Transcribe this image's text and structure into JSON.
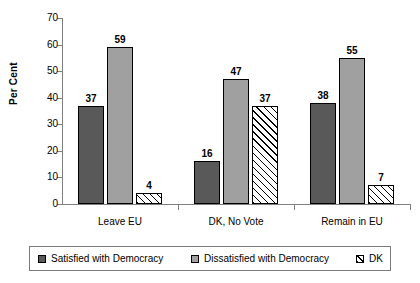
{
  "chart_data": {
    "type": "bar",
    "title": "",
    "subtitle": "",
    "xlabel": "",
    "ylabel": "Per Cent",
    "ylim": [
      0,
      70
    ],
    "ytick_step": 10,
    "yticks": [
      70,
      60,
      50,
      40,
      30,
      20,
      10,
      0
    ],
    "grid": false,
    "legend_position": "bottom",
    "categories": [
      "Leave EU",
      "DK, No Vote",
      "Remain in EU"
    ],
    "series": [
      {
        "name": "Satisfied with Democracy",
        "key": "satisfied",
        "color": "#595959",
        "pattern": "solid",
        "values": [
          37,
          16,
          38
        ]
      },
      {
        "name": "Dissatisfied with Democracy",
        "key": "dissat",
        "color": "#a0a0a0",
        "pattern": "solid",
        "values": [
          59,
          47,
          55
        ]
      },
      {
        "name": "DK",
        "key": "dk",
        "color": "#ffffff",
        "pattern": "diagonal-hatch",
        "values": [
          4,
          37,
          7
        ]
      }
    ]
  },
  "axis": {
    "y_title": "Per Cent",
    "y_labels": [
      "70",
      "60",
      "50",
      "40",
      "30",
      "20",
      "10",
      "0"
    ],
    "x_labels": [
      "Leave EU",
      "DK, No Vote",
      "Remain in EU"
    ]
  },
  "data_labels": {
    "group0": [
      "37",
      "59",
      "4"
    ],
    "group1": [
      "16",
      "47",
      "37"
    ],
    "group2": [
      "38",
      "55",
      "7"
    ]
  },
  "legend": {
    "items": [
      {
        "label": "Satisfied with Democracy",
        "swatch": "satisfied"
      },
      {
        "label": "Dissatisfied with Democracy",
        "swatch": "dissat"
      },
      {
        "label": "DK",
        "swatch": "dk"
      }
    ]
  },
  "colors": {
    "satisfied": "#595959",
    "dissatisfied": "#a0a0a0",
    "dk": "#ffffff",
    "axis": "#808080",
    "outline": "#000000",
    "background": "#ffffff"
  }
}
